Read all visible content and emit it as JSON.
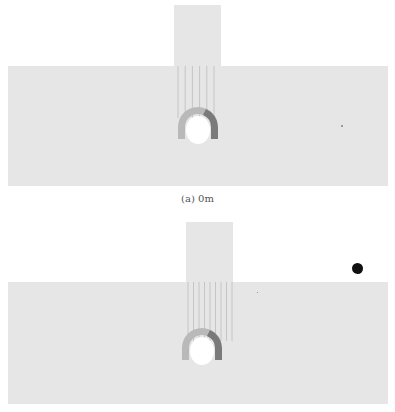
{
  "figure": {
    "panels": [
      {
        "id": "a",
        "caption": "(a) 0m",
        "column_lines": 6
      },
      {
        "id": "b",
        "caption": "",
        "column_lines": 9
      }
    ]
  },
  "colors": {
    "rock_mass": "#e6e6e6",
    "lining_light": "#b9b9b9",
    "lining_dark": "#7a7a7a",
    "opening": "#ffffff",
    "bolt_lines": "#bdbdbd",
    "caption": "#555555"
  }
}
